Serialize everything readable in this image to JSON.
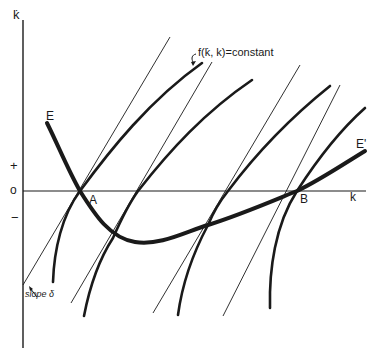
{
  "figure": {
    "axes": {
      "y_label": "k̇",
      "x_label": "k",
      "y_ticks": [
        {
          "label": "+",
          "meaning": "positive k̇"
        },
        {
          "label": "o",
          "meaning": "zero"
        },
        {
          "label": "−",
          "meaning": "negative k̇"
        }
      ]
    },
    "curve_labels": {
      "E_start": "E",
      "E_end": "E'",
      "constant": "f(k̇, k)=constant",
      "slope": "slope δ"
    },
    "points": {
      "A": "A",
      "B": "B"
    },
    "elements": {
      "E_curve": "thick U-shaped locus E–E' crossing k-axis at A and B",
      "iso_curves": 4,
      "tangent_lines": 4
    }
  },
  "colors": {
    "ink": "#1a1a1a",
    "background": "#ffffff"
  }
}
